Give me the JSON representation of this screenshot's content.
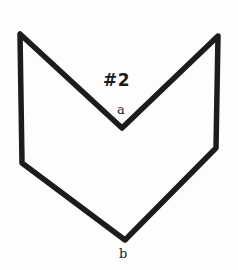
{
  "figure": {
    "title": "#2",
    "background_color": "#fdfdfd",
    "stroke_color": "#1c1c1c",
    "stroke_width": 5.5,
    "style": "hand-drawn",
    "shape_name": "concave-chevron-polygon",
    "outline_path": "M 20 34 L 22 163 L 125 240 L 216 148 L 218 36 L 122 128 Z",
    "vertices": [
      {
        "name": "top-left-corner",
        "x": 20,
        "y": 34,
        "label": ""
      },
      {
        "name": "bottom-left-corner",
        "x": 22,
        "y": 163,
        "label": ""
      },
      {
        "name": "bottom-point",
        "x": 125,
        "y": 240,
        "label": "b"
      },
      {
        "name": "bottom-right-corner",
        "x": 216,
        "y": 148,
        "label": ""
      },
      {
        "name": "top-right-corner",
        "x": 218,
        "y": 36,
        "label": ""
      },
      {
        "name": "inner-notch-point",
        "x": 122,
        "y": 128,
        "label": "a"
      }
    ],
    "labels": {
      "vertex_a": "a",
      "vertex_b": "b"
    }
  }
}
